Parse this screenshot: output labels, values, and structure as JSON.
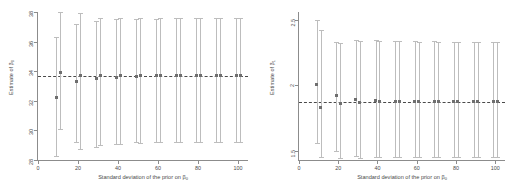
{
  "figure": {
    "background": "#ffffff",
    "marker_color": "#6e6e6e",
    "bar_color": "#bdbdbd",
    "axis_color": "#8c8c8c",
    "ref_color": "#4a4a4a"
  },
  "panels": [
    {
      "id": "left-panel",
      "xlabel_prefix": "Standard deviation of the prior on β",
      "xlabel_sub": "0",
      "ylabel_prefix": "Estimate of β",
      "ylabel_sub": "0",
      "xticks": [
        "0",
        "20",
        "40",
        "60",
        "80",
        "100"
      ],
      "yticks": [
        "28",
        "30",
        "32",
        "34",
        "36",
        "38"
      ]
    },
    {
      "id": "right-panel",
      "xlabel_prefix": "Standard deviation of the prior on β",
      "xlabel_sub": "0",
      "ylabel_prefix": "Estimate of β",
      "ylabel_sub": "1",
      "xticks": [
        "0",
        "20",
        "40",
        "60",
        "80",
        "100"
      ],
      "yticks": [
        "1.5",
        "2",
        "2.5"
      ]
    }
  ],
  "chart_data": [
    {
      "type": "scatter",
      "id": "left-panel",
      "title": "",
      "xlabel": "Standard deviation of the prior on β0",
      "ylabel": "Estimate of β0",
      "xlim": [
        0,
        105
      ],
      "ylim": [
        28,
        38
      ],
      "xticks": [
        0,
        20,
        40,
        60,
        80,
        100
      ],
      "yticks": [
        28,
        30,
        32,
        34,
        36,
        38
      ],
      "grid": false,
      "legend": "none",
      "reference_line": {
        "y": 33.7,
        "style": "dashed"
      },
      "series": [
        {
          "name": "series A (left of pair)",
          "x": [
            9,
            19,
            29,
            39,
            49,
            59,
            69,
            79,
            89,
            99
          ],
          "y": [
            32.2,
            33.3,
            33.5,
            33.6,
            33.65,
            33.68,
            33.7,
            33.7,
            33.7,
            33.7
          ],
          "ci_low": [
            28.3,
            29.2,
            28.9,
            29.1,
            29.2,
            29.2,
            29.2,
            29.2,
            29.2,
            29.2
          ],
          "ci_high": [
            36.3,
            37.2,
            37.4,
            37.5,
            37.5,
            37.55,
            37.6,
            37.6,
            37.6,
            37.6
          ]
        },
        {
          "name": "series B (right of pair)",
          "x": [
            11,
            21,
            31,
            41,
            51,
            61,
            71,
            81,
            91,
            101
          ],
          "y": [
            33.9,
            33.7,
            33.7,
            33.72,
            33.72,
            33.72,
            33.72,
            33.72,
            33.72,
            33.72
          ],
          "ci_low": [
            30.1,
            28.75,
            29.0,
            29.1,
            29.15,
            29.2,
            29.2,
            29.2,
            29.2,
            29.2
          ],
          "ci_high": [
            38.0,
            37.9,
            37.6,
            37.6,
            37.6,
            37.6,
            37.6,
            37.6,
            37.6,
            37.6
          ]
        }
      ]
    },
    {
      "type": "scatter",
      "id": "right-panel",
      "title": "",
      "xlabel": "Standard deviation of the prior on β0",
      "ylabel": "Estimate of β1",
      "xlim": [
        0,
        105
      ],
      "ylim": [
        1.43,
        2.56
      ],
      "xticks": [
        0,
        20,
        40,
        60,
        80,
        100
      ],
      "yticks": [
        1.5,
        2.0,
        2.5
      ],
      "grid": false,
      "legend": "none",
      "reference_line": {
        "y": 1.875,
        "style": "dashed"
      },
      "series": [
        {
          "name": "series A (left of pair)",
          "x": [
            9,
            19,
            29,
            39,
            49,
            59,
            69,
            79,
            89,
            99
          ],
          "y": [
            2.01,
            1.92,
            1.89,
            1.885,
            1.88,
            1.878,
            1.877,
            1.876,
            1.876,
            1.876
          ],
          "ci_low": [
            1.56,
            1.5,
            1.46,
            1.455,
            1.45,
            1.45,
            1.45,
            1.45,
            1.45,
            1.45
          ],
          "ci_high": [
            2.5,
            2.33,
            2.35,
            2.35,
            2.34,
            2.34,
            2.34,
            2.33,
            2.33,
            2.33
          ]
        },
        {
          "name": "series B (right of pair)",
          "x": [
            11,
            21,
            31,
            41,
            51,
            61,
            71,
            81,
            91,
            101
          ],
          "y": [
            1.83,
            1.865,
            1.87,
            1.873,
            1.875,
            1.875,
            1.876,
            1.876,
            1.876,
            1.876
          ],
          "ci_low": [
            1.45,
            1.445,
            1.445,
            1.45,
            1.45,
            1.45,
            1.45,
            1.45,
            1.45,
            1.45
          ],
          "ci_high": [
            2.42,
            2.32,
            2.34,
            2.34,
            2.34,
            2.33,
            2.33,
            2.33,
            2.33,
            2.33
          ]
        }
      ]
    }
  ]
}
